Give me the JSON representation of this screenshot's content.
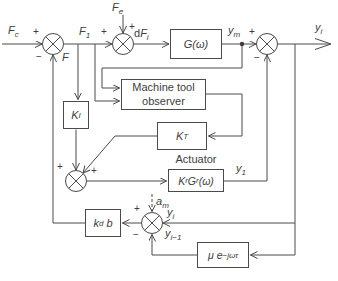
{
  "signs": {
    "plus": "+",
    "minus": "−"
  },
  "labels": {
    "fc": {
      "base": "F",
      "sub": "c"
    },
    "fe": {
      "base": "F",
      "sub": "e"
    },
    "f1": {
      "base": "F",
      "sub": "1"
    },
    "f": {
      "base": "F"
    },
    "dfi": {
      "pre": "d",
      "base": "F",
      "sub": "i"
    },
    "ym": {
      "base": "y",
      "sub": "m"
    },
    "yi_out": {
      "base": "y",
      "sub": "i"
    },
    "y1": {
      "base": "y",
      "sub": "1"
    },
    "am": {
      "base": "a",
      "sub": "m"
    },
    "yi_fb": {
      "base": "y",
      "sub": "i"
    },
    "yi_prev": {
      "base": "y",
      "sub": "i−1"
    }
  },
  "blocks": {
    "plant": {
      "label": "G(ω)"
    },
    "observer": {
      "line1": "Machine tool",
      "line2": "observer"
    },
    "observer_gain": {
      "base": "K",
      "sup": "T"
    },
    "integral_gain": {
      "base": "K",
      "sub": "I"
    },
    "actuator": {
      "title": "Actuator",
      "k": "K",
      "k_sub": "r",
      "g": "G",
      "g_sub": "r",
      "omega": "(ω)"
    },
    "displacement_gain": {
      "k": "k",
      "k_sub": "d",
      "b": "b"
    },
    "delay": {
      "base": "μ e",
      "sup": "−jωτ"
    }
  }
}
